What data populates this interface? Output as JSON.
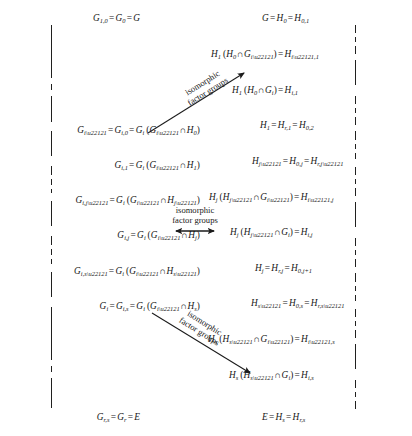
{
  "figure": {
    "background_color": "#ffffff",
    "ink_color": "#1a1a1a",
    "width": 412,
    "height": 436
  },
  "left_chain": {
    "name": "G-series",
    "axis_x": 51,
    "labels": [
      {
        "id": "g-top",
        "text": "G₁,₀ = G₀ = G",
        "y": 14,
        "anchor_x": 140,
        "align": "right"
      },
      {
        "id": "g-i-1",
        "text": "Gᵢ₋₁ = Gᵢ,₀ = Gᵢ (Gᵢ₋₁ ∩ H₀)",
        "y": 126,
        "anchor_x": 200,
        "align": "right"
      },
      {
        "id": "g-i-1-alt",
        "text": "Gᵢ,₁ = Gᵢ (Gᵢ₋₁ ∩ H₁)",
        "y": 161,
        "anchor_x": 200,
        "align": "right"
      },
      {
        "id": "g-ij-1",
        "text": "Gᵢ,ⱼ₋₁ = Gᵢ (Gᵢ₋₁ ∩ Hⱼ₋₁)",
        "y": 196,
        "anchor_x": 200,
        "align": "right"
      },
      {
        "id": "g-ij",
        "text": "Gᵢ,ⱼ = Gᵢ (Gᵢ₋₁ ∩ Hⱼ)",
        "y": 231,
        "anchor_x": 200,
        "align": "right"
      },
      {
        "id": "g-is-1",
        "text": "Gᵢ,ₛ₋₁ = Gᵢ (Gᵢ₋₁ ∩ Hₛ₋₁)",
        "y": 267,
        "anchor_x": 200,
        "align": "right"
      },
      {
        "id": "g-i",
        "text": "Gᵢ = Gᵢ,ₛ = Gᵢ (Gᵢ₋₁ ∩ Hₛ)",
        "y": 302,
        "anchor_x": 200,
        "align": "right"
      },
      {
        "id": "g-bottom",
        "text": "Gᵣ,ₛ = Gᵣ = E",
        "y": 413,
        "anchor_x": 140,
        "align": "right"
      }
    ]
  },
  "right_chain": {
    "name": "H-series",
    "axis_x": 355,
    "labels": [
      {
        "id": "h-top",
        "text": "G = H₀ = H₀,₁",
        "y": 14,
        "anchor_x": 262,
        "align": "left"
      },
      {
        "id": "h-i-1-1",
        "text": "H₁ (H₀ ∩ Gᵢ₋₁) = Hᵢ₋₁,₁",
        "y": 50,
        "anchor_x": 211,
        "align": "left"
      },
      {
        "id": "h-i-1",
        "text": "H₁ (H₀ ∩ Gᵢ) = Hᵢ,₁",
        "y": 86,
        "anchor_x": 232,
        "align": "left"
      },
      {
        "id": "h-1",
        "text": "H₁ = Hᵣ,₁ = H₀,₂",
        "y": 121,
        "anchor_x": 260,
        "align": "left"
      },
      {
        "id": "h-j-1",
        "text": "Hⱼ₋₁ = H₀,ⱼ = Hᵣ,ⱼ₋₁",
        "y": 157,
        "anchor_x": 252,
        "align": "left"
      },
      {
        "id": "h-i-1-j",
        "text": "Hⱼ (Hⱼ₋₁ ∩ Gᵢ₋₁) = Hᵢ₋₁,ⱼ",
        "y": 193,
        "anchor_x": 209,
        "align": "left"
      },
      {
        "id": "h-ij",
        "text": "Hⱼ (Hⱼ₋₁ ∩ Gᵢ) = Hᵢ,ⱼ",
        "y": 228,
        "anchor_x": 230,
        "align": "left"
      },
      {
        "id": "h-j",
        "text": "Hⱼ = Hᵣ,ⱼ = H₀,ⱼ₊₁",
        "y": 264,
        "anchor_x": 255,
        "align": "left"
      },
      {
        "id": "h-s-1",
        "text": "Hₛ₋₁ = H₀,ₛ = Hᵣ,ₛ₋₁",
        "y": 299,
        "anchor_x": 251,
        "align": "left"
      },
      {
        "id": "h-i-1-s",
        "text": "Hₛ (Hₛ₋₁ ∩ Gᵢ₋₁) = Hᵢ₋₁,ₛ",
        "y": 335,
        "anchor_x": 208,
        "align": "left"
      },
      {
        "id": "h-is",
        "text": "Hₛ (Hₛ₋₁ ∩ Gᵢ) = Hᵢ,ₛ",
        "y": 371,
        "anchor_x": 229,
        "align": "left"
      },
      {
        "id": "h-bottom",
        "text": "E = Hₛ = Hᵣ,ₛ",
        "y": 413,
        "anchor_x": 262,
        "align": "left"
      }
    ]
  },
  "arrows": [
    {
      "id": "arrow-top",
      "direction": "up-right",
      "heads": "single",
      "label_line1": "isomorphic",
      "label_line2": "factor groups",
      "rotation_deg": -28
    },
    {
      "id": "arrow-middle",
      "direction": "horizontal",
      "heads": "double",
      "label_line1": "isomorphic",
      "label_line2": "factor groups",
      "rotation_deg": 0
    },
    {
      "id": "arrow-bottom",
      "direction": "down-right",
      "heads": "single",
      "label_line1": "isomorphic",
      "label_line2": "factor groups",
      "rotation_deg": 28
    }
  ]
}
